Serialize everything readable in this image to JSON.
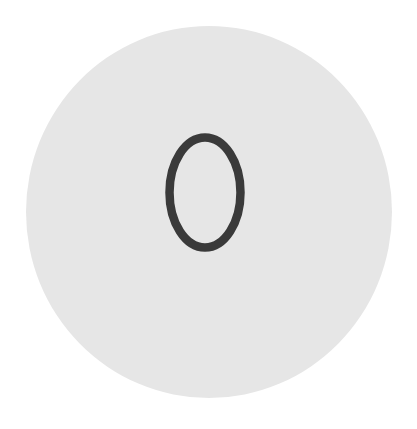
{
  "badge": {
    "value": "0",
    "background_color": "#e6e6e6",
    "digit_color": "#3a3a3a"
  }
}
